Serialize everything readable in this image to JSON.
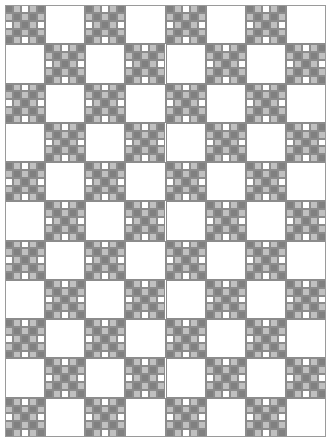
{
  "artwork": {
    "title": "Nine Patch Lattice Quilt",
    "description": "Monochrome grayscale patchwork quilt layout composed of five-by-five checkerboard nine-patch blocks alternating with plain white blocks, forming a diagonal lattice of X shapes.",
    "canvas": {
      "width": 321,
      "height": 432,
      "offset_x": 5,
      "offset_y": 5,
      "background": "#ffffff",
      "border_color": "#9a9a9a",
      "border_width": 1
    },
    "grid": {
      "columns": 8,
      "rows": 11,
      "block_width": 40,
      "block_height": 39,
      "patch_columns": 5,
      "patch_rows": 5
    },
    "colors": {
      "dark": "#808080",
      "light": "#c0c0c0",
      "white": "#ffffff",
      "seam": "#8c8c8c",
      "background": "#ffffff"
    },
    "legend": [
      {
        "name": "dark-gray-patch",
        "hex": "#808080",
        "label": "Dark gray"
      },
      {
        "name": "light-gray-patch",
        "hex": "#c0c0c0",
        "label": "Light gray"
      },
      {
        "name": "white-patch",
        "hex": "#ffffff",
        "label": "White"
      }
    ],
    "block_types": {
      "checker": "checkerboard",
      "plain": "plain-white"
    },
    "block_layout": [
      [
        "checker",
        "plain",
        "checker",
        "plain",
        "checker",
        "plain",
        "checker",
        "plain"
      ],
      [
        "plain",
        "checker",
        "plain",
        "checker",
        "plain",
        "checker",
        "plain",
        "checker"
      ],
      [
        "checker",
        "plain",
        "checker",
        "plain",
        "checker",
        "plain",
        "checker",
        "plain"
      ],
      [
        "plain",
        "checker",
        "plain",
        "checker",
        "plain",
        "checker",
        "plain",
        "checker"
      ],
      [
        "checker",
        "plain",
        "checker",
        "plain",
        "checker",
        "plain",
        "checker",
        "plain"
      ],
      [
        "plain",
        "checker",
        "plain",
        "checker",
        "plain",
        "checker",
        "plain",
        "checker"
      ],
      [
        "checker",
        "plain",
        "checker",
        "plain",
        "checker",
        "plain",
        "checker",
        "plain"
      ],
      [
        "plain",
        "checker",
        "plain",
        "checker",
        "plain",
        "checker",
        "plain",
        "checker"
      ],
      [
        "checker",
        "plain",
        "checker",
        "plain",
        "checker",
        "plain",
        "checker",
        "plain"
      ],
      [
        "plain",
        "checker",
        "plain",
        "checker",
        "plain",
        "checker",
        "plain",
        "checker"
      ],
      [
        "checker",
        "plain",
        "checker",
        "plain",
        "checker",
        "plain",
        "checker",
        "plain"
      ]
    ],
    "patch_pattern": [
      [
        "dark",
        "light",
        "white",
        "light",
        "dark"
      ],
      [
        "light",
        "dark",
        "light",
        "dark",
        "light"
      ],
      [
        "white",
        "light",
        "dark",
        "light",
        "white"
      ],
      [
        "light",
        "dark",
        "light",
        "dark",
        "light"
      ],
      [
        "dark",
        "light",
        "white",
        "light",
        "dark"
      ]
    ]
  }
}
